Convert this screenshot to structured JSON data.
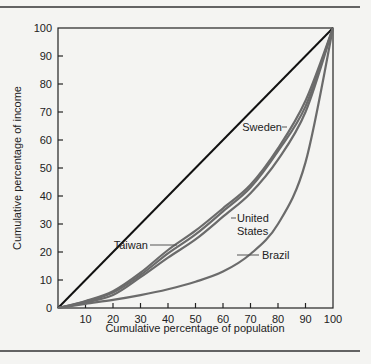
{
  "chart_data": {
    "type": "line",
    "title": "",
    "xlabel": "Cumulative percentage of population",
    "ylabel": "Cumulative percentage of income",
    "xlim": [
      0,
      100
    ],
    "ylim": [
      0,
      100
    ],
    "x_ticks": [
      10,
      20,
      30,
      40,
      50,
      60,
      70,
      80,
      90,
      100
    ],
    "y_ticks": [
      0,
      10,
      20,
      30,
      40,
      50,
      60,
      70,
      80,
      90,
      100
    ],
    "grid": false,
    "legend": "inline labels",
    "x": [
      0,
      10,
      20,
      30,
      40,
      50,
      60,
      70,
      80,
      90,
      100
    ],
    "series": [
      {
        "name": "Line of equality",
        "color": "#111111",
        "values": [
          0,
          10,
          20,
          30,
          40,
          50,
          60,
          70,
          80,
          90,
          100
        ]
      },
      {
        "name": "Sweden",
        "color": "#6b6b6b",
        "values": [
          0,
          2.5,
          6,
          12.6,
          20.7,
          27.6,
          35.6,
          44,
          57,
          74,
          100
        ]
      },
      {
        "name": "Taiwan",
        "color": "#6b6b6b",
        "values": [
          0,
          2.3,
          5.5,
          11.8,
          19.5,
          26.3,
          34.5,
          43,
          56,
          72,
          100
        ]
      },
      {
        "name": "United States",
        "color": "#6b6b6b",
        "values": [
          0,
          2,
          4.6,
          11,
          18,
          24.5,
          32.6,
          41,
          53,
          70,
          100
        ]
      },
      {
        "name": "Brazil",
        "color": "#6b6b6b",
        "values": [
          0,
          1.5,
          2.9,
          4.6,
          6.7,
          9.4,
          13,
          19.3,
          30,
          52,
          100
        ]
      }
    ],
    "annotations": [
      {
        "text": "Sweden",
        "lines": [
          "Sweden"
        ]
      },
      {
        "text": "Taiwan",
        "lines": [
          "Taiwan"
        ]
      },
      {
        "text": "United States",
        "lines": [
          "United",
          "States"
        ]
      },
      {
        "text": "Brazil",
        "lines": [
          "Brazil"
        ]
      }
    ]
  }
}
